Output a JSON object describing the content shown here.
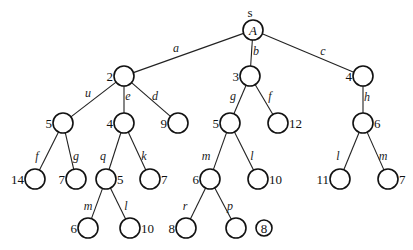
{
  "diagram": {
    "type": "search-tree",
    "root": {
      "id": "A",
      "inner_label": "A",
      "top_label": "s"
    },
    "nodes": [
      {
        "id": "A",
        "x": 253,
        "y": 30,
        "r": 10,
        "label": "",
        "inner": "A",
        "label_side": "none"
      },
      {
        "id": "n2",
        "x": 124,
        "y": 76,
        "r": 10,
        "label": "2",
        "label_side": "left"
      },
      {
        "id": "n3",
        "x": 250,
        "y": 76,
        "r": 10,
        "label": "3",
        "label_side": "left"
      },
      {
        "id": "n4",
        "x": 363,
        "y": 76,
        "r": 10,
        "label": "4",
        "label_side": "left"
      },
      {
        "id": "n5a",
        "x": 63,
        "y": 123,
        "r": 10,
        "label": "5",
        "label_side": "left"
      },
      {
        "id": "n4b",
        "x": 124,
        "y": 123,
        "r": 10,
        "label": "4",
        "label_side": "left"
      },
      {
        "id": "n9",
        "x": 178,
        "y": 123,
        "r": 10,
        "label": "9",
        "label_side": "left"
      },
      {
        "id": "n5c",
        "x": 230,
        "y": 123,
        "r": 10,
        "label": "5",
        "label_side": "left"
      },
      {
        "id": "n12",
        "x": 278,
        "y": 123,
        "r": 10,
        "label": "12",
        "label_side": "right"
      },
      {
        "id": "n6d",
        "x": 363,
        "y": 123,
        "r": 10,
        "label": "6",
        "label_side": "right"
      },
      {
        "id": "n14",
        "x": 35,
        "y": 179,
        "r": 10,
        "label": "14",
        "label_side": "left"
      },
      {
        "id": "n7e",
        "x": 76,
        "y": 179,
        "r": 10,
        "label": "7",
        "label_side": "left"
      },
      {
        "id": "n5f",
        "x": 106,
        "y": 179,
        "r": 10,
        "label": "5",
        "label_side": "right"
      },
      {
        "id": "n7g",
        "x": 150,
        "y": 179,
        "r": 10,
        "label": "7",
        "label_side": "right"
      },
      {
        "id": "n6h",
        "x": 210,
        "y": 179,
        "r": 10,
        "label": "6",
        "label_side": "left"
      },
      {
        "id": "n10i",
        "x": 258,
        "y": 179,
        "r": 10,
        "label": "10",
        "label_side": "right"
      },
      {
        "id": "n11",
        "x": 340,
        "y": 179,
        "r": 10,
        "label": "11",
        "label_side": "left"
      },
      {
        "id": "n7j",
        "x": 388,
        "y": 179,
        "r": 10,
        "label": "7",
        "label_side": "right"
      },
      {
        "id": "n6k",
        "x": 88,
        "y": 228,
        "r": 10,
        "label": "6",
        "label_side": "left"
      },
      {
        "id": "n10l",
        "x": 130,
        "y": 228,
        "r": 10,
        "label": "10",
        "label_side": "right"
      },
      {
        "id": "n8m",
        "x": 186,
        "y": 228,
        "r": 10,
        "label": "8",
        "label_side": "left"
      },
      {
        "id": "np",
        "x": 236,
        "y": 228,
        "r": 10,
        "label": "",
        "label_side": "none"
      },
      {
        "id": "n8circ",
        "x": 264,
        "y": 228,
        "r": 8,
        "label": "",
        "inner": "8",
        "label_side": "none",
        "standalone": true
      }
    ],
    "edges": [
      {
        "from": "A",
        "to": "n2",
        "label": "a",
        "lx": 176,
        "ly": 52
      },
      {
        "from": "A",
        "to": "n3",
        "label": "b",
        "lx": 256,
        "ly": 55
      },
      {
        "from": "A",
        "to": "n4",
        "label": "c",
        "lx": 323,
        "ly": 55
      },
      {
        "from": "n2",
        "to": "n5a",
        "label": "u",
        "lx": 88,
        "ly": 97
      },
      {
        "from": "n2",
        "to": "n4b",
        "label": "e",
        "lx": 128,
        "ly": 100
      },
      {
        "from": "n2",
        "to": "n9",
        "label": "d",
        "lx": 155,
        "ly": 100
      },
      {
        "from": "n3",
        "to": "n5c",
        "label": "g",
        "lx": 233,
        "ly": 100
      },
      {
        "from": "n3",
        "to": "n12",
        "label": "f",
        "lx": 270,
        "ly": 100
      },
      {
        "from": "n4",
        "to": "n6d",
        "label": "h",
        "lx": 367,
        "ly": 101
      },
      {
        "from": "n5a",
        "to": "n14",
        "label": "f",
        "lx": 37,
        "ly": 160
      },
      {
        "from": "n5a",
        "to": "n7e",
        "label": "g",
        "lx": 76,
        "ly": 160
      },
      {
        "from": "n4b",
        "to": "n5f",
        "label": "q",
        "lx": 103,
        "ly": 160
      },
      {
        "from": "n4b",
        "to": "n7g",
        "label": "k",
        "lx": 144,
        "ly": 160
      },
      {
        "from": "n5c",
        "to": "n6h",
        "label": "m",
        "lx": 206,
        "ly": 160
      },
      {
        "from": "n5c",
        "to": "n10i",
        "label": "l",
        "lx": 252,
        "ly": 160
      },
      {
        "from": "n6d",
        "to": "n11",
        "label": "l",
        "lx": 338,
        "ly": 160
      },
      {
        "from": "n6d",
        "to": "n7j",
        "label": "m",
        "lx": 383,
        "ly": 160
      },
      {
        "from": "n5f",
        "to": "n6k",
        "label": "m",
        "lx": 88,
        "ly": 210
      },
      {
        "from": "n5f",
        "to": "n10l",
        "label": "l",
        "lx": 126,
        "ly": 210
      },
      {
        "from": "n6h",
        "to": "n8m",
        "label": "r",
        "lx": 185,
        "ly": 210
      },
      {
        "from": "n6h",
        "to": "np",
        "label": "p",
        "lx": 230,
        "ly": 210
      }
    ]
  }
}
